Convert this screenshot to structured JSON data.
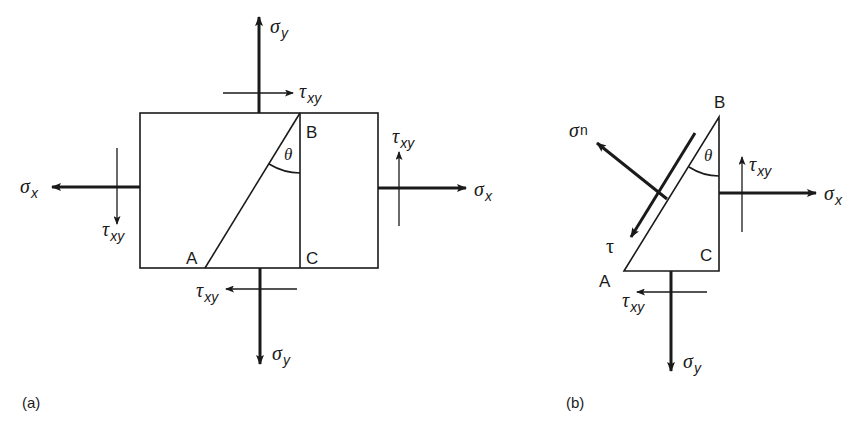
{
  "figure": {
    "panel_a": {
      "caption": "(a)",
      "points": {
        "A": "A",
        "B": "B",
        "C": "C"
      },
      "angle": "θ",
      "labels": {
        "sigma_y_top": {
          "sym": "σ",
          "sub": "y"
        },
        "tau_top": {
          "sym": "τ",
          "sub": "xy"
        },
        "sigma_x_left": {
          "sym": "σ",
          "sub": "x"
        },
        "tau_left": {
          "sym": "τ",
          "sub": "xy"
        },
        "sigma_x_right": {
          "sym": "σ",
          "sub": "x"
        },
        "tau_right": {
          "sym": "τ",
          "sub": "xy"
        },
        "sigma_y_bottom": {
          "sym": "σ",
          "sub": "y"
        },
        "tau_bottom": {
          "sym": "τ",
          "sub": "xy"
        }
      }
    },
    "panel_b": {
      "caption": "(b)",
      "points": {
        "A": "A",
        "B": "B",
        "C": "C"
      },
      "angle": "θ",
      "labels": {
        "sigma_n": {
          "sym": "σ",
          "sub": "n"
        },
        "tau": {
          "sym": "τ"
        },
        "sigma_x": {
          "sym": "σ",
          "sub": "x"
        },
        "tau_right": {
          "sym": "τ",
          "sub": "xy"
        },
        "sigma_y": {
          "sym": "σ",
          "sub": "y"
        },
        "tau_bottom": {
          "sym": "τ",
          "sub": "xy"
        }
      }
    }
  }
}
